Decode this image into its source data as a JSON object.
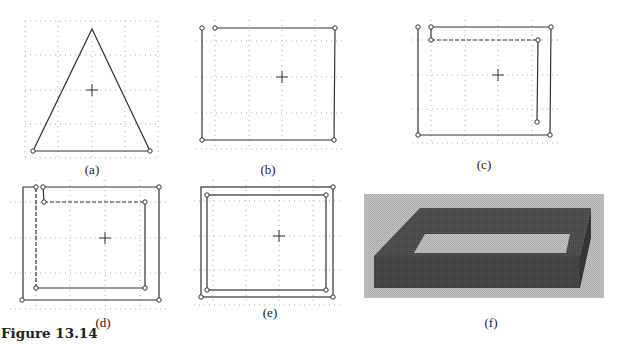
{
  "figure": {
    "caption": "Figure 13.14",
    "panels": [
      {
        "id": "a",
        "label": "(a)",
        "description": "Triangle profile with center marker on dotted grid"
      },
      {
        "id": "b",
        "label": "(b)",
        "description": "Open rectangular profile (gap at top-left) on dotted grid"
      },
      {
        "id": "c",
        "label": "(c)",
        "description": "Rectangular profile with inner offset path being drawn (dashed)"
      },
      {
        "id": "d",
        "label": "(d)",
        "description": "Outer and inner offset rectangular paths, inner left edge dashed"
      },
      {
        "id": "e",
        "label": "(e)",
        "description": "Closed double rectangular profile (outer and inner)"
      },
      {
        "id": "f",
        "label": "(f)",
        "description": "Shaded 3D extrusion of the rectangular frame"
      }
    ]
  },
  "colors": {
    "line": "#333333",
    "grid": "#9a9a9a",
    "solid_bg": "#b8b8b8",
    "solid_dark": "#3c3c3c",
    "solid_top": "#4a4a4a"
  }
}
